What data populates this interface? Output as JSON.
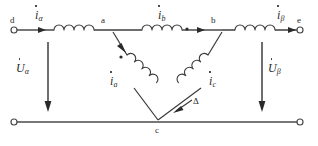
{
  "diagram": {
    "stroke_color": "#4a4a4a",
    "text_color": "#2b2b2b",
    "terminals": [
      {
        "id": "d",
        "label": "d",
        "x": 14,
        "y": 30
      },
      {
        "id": "e",
        "label": "e",
        "x": 300,
        "y": 30
      },
      {
        "id": "bl",
        "label": "",
        "x": 14,
        "y": 122
      },
      {
        "id": "br",
        "label": "",
        "x": 300,
        "y": 122
      }
    ],
    "nodes": [
      {
        "id": "a",
        "label": "a",
        "x": 104,
        "y": 30
      },
      {
        "id": "b",
        "label": "b",
        "x": 213,
        "y": 30
      },
      {
        "id": "c",
        "label": "c",
        "x": 158,
        "y": 122
      }
    ],
    "currents": [
      {
        "id": "i-alpha",
        "symbol": "i",
        "subscript": "α",
        "phasor": true
      },
      {
        "id": "i-b",
        "symbol": "i",
        "subscript": "b",
        "phasor": true
      },
      {
        "id": "i-beta",
        "symbol": "i",
        "subscript": "β",
        "phasor": true
      },
      {
        "id": "i-a",
        "symbol": "i",
        "subscript": "a",
        "phasor": true
      },
      {
        "id": "i-c",
        "symbol": "i",
        "subscript": "c",
        "phasor": true
      }
    ],
    "voltages": [
      {
        "id": "u-alpha",
        "symbol": "U",
        "subscript": "α",
        "phasor": true
      },
      {
        "id": "u-beta",
        "symbol": "U",
        "subscript": "β",
        "phasor": true
      }
    ],
    "connection_symbol": "Δ",
    "polarity_dots": 3
  }
}
